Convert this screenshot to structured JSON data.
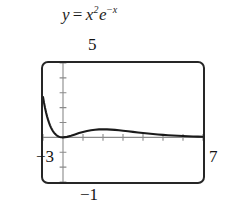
{
  "figure": {
    "equation": {
      "lhs": "y",
      "operator": "=",
      "base": "x",
      "exponent": "2",
      "factor": "e",
      "factor_exponent_sign": "−",
      "factor_exponent": "x",
      "plain": "y = x²e⁻ˣ"
    },
    "window_labels": {
      "ymax": "5",
      "ymin": "−1",
      "xmin": "−3",
      "xmax": "7"
    },
    "colors": {
      "curve": "#1a1a1a",
      "frame": "#262626",
      "axis": "#8a8a8a",
      "background": "#ffffff",
      "text": "#141414"
    }
  },
  "chart_data": {
    "type": "line",
    "xlabel": "",
    "ylabel": "",
    "grid": false,
    "legend": false,
    "xlim": [
      -1,
      7
    ],
    "ylim": [
      -3,
      5
    ],
    "axis_tick_spacing": {
      "x": 1,
      "y": 1
    },
    "labeled_ticks": {
      "ymax_label": "5",
      "ymin_label": "−1",
      "xmin_label": "−3",
      "xmax_label": "7"
    },
    "annotations": [
      {
        "text": "local minimum at x = 0, y = 0"
      },
      {
        "text": "local maximum at x = 2, y ≈ 0.54"
      },
      {
        "text": "curve exits top of window near x ≈ -0.85"
      }
    ],
    "series": [
      {
        "name": "y = x²e⁻ˣ",
        "x": [
          -1.0,
          -0.95,
          -0.9,
          -0.85,
          -0.8,
          -0.75,
          -0.7,
          -0.65,
          -0.6,
          -0.55,
          -0.5,
          -0.45,
          -0.4,
          -0.35,
          -0.3,
          -0.25,
          -0.2,
          -0.15,
          -0.1,
          -0.05,
          0.0,
          0.2,
          0.4,
          0.6,
          0.8,
          1.0,
          1.2,
          1.4,
          1.6,
          1.8,
          2.0,
          2.2,
          2.4,
          2.6,
          2.8,
          3.0,
          3.25,
          3.5,
          3.75,
          4.0,
          4.25,
          4.5,
          4.75,
          5.0,
          5.25,
          5.5,
          5.75,
          6.0,
          6.25,
          6.5,
          6.75,
          7.0
        ],
        "y": [
          2.718,
          2.331,
          1.992,
          1.694,
          1.424,
          1.191,
          0.987,
          0.81,
          0.656,
          0.524,
          0.412,
          0.318,
          0.239,
          0.174,
          0.121,
          0.08,
          0.049,
          0.026,
          0.011,
          0.003,
          0.0,
          0.033,
          0.107,
          0.198,
          0.288,
          0.368,
          0.434,
          0.483,
          0.517,
          0.536,
          0.541,
          0.536,
          0.523,
          0.502,
          0.477,
          0.448,
          0.41,
          0.37,
          0.332,
          0.293,
          0.257,
          0.225,
          0.195,
          0.168,
          0.145,
          0.124,
          0.105,
          0.089,
          0.075,
          0.063,
          0.053,
          0.045
        ]
      }
    ]
  }
}
